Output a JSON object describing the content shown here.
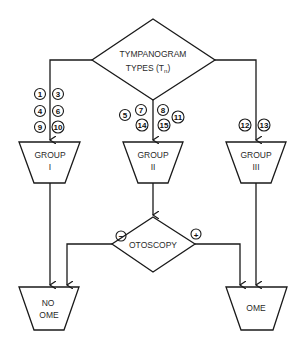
{
  "diagram": {
    "decision_top": {
      "line1": "TYMPANOGRAM",
      "line2": "TYPES (T",
      "subscript": "n",
      "close": ")"
    },
    "groups": [
      {
        "line1": "GROUP",
        "line2": "I",
        "types": [
          "1",
          "3",
          "4",
          "6",
          "9",
          "10"
        ]
      },
      {
        "line1": "GROUP",
        "line2": "II",
        "types": [
          "5",
          "7",
          "8",
          "11",
          "14",
          "15"
        ]
      },
      {
        "line1": "GROUP",
        "line2": "III",
        "types": [
          "12",
          "13"
        ]
      }
    ],
    "decision_otoscopy": {
      "label": "OTOSCOPY",
      "negative": "−",
      "positive": "+"
    },
    "outcomes": [
      {
        "line1": "NO",
        "line2": "OME"
      },
      {
        "line1": "OME"
      }
    ],
    "colors": {
      "stroke": "#1a1a1a",
      "background": "#ffffff"
    }
  }
}
